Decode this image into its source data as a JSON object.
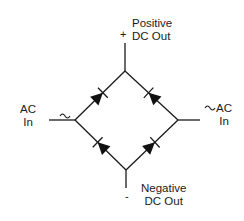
{
  "diagram": {
    "type": "bridge-rectifier",
    "colors": {
      "line": "#1a1a1a",
      "background": "#ffffff"
    },
    "labels": {
      "positive_out": {
        "line1": "Positive",
        "line2": "DC Out",
        "polarity": "+"
      },
      "negative_out": {
        "line1": "Negative",
        "line2": "DC Out",
        "polarity": "-"
      },
      "ac_in_left": {
        "line1": "AC",
        "line2": "In",
        "symbol": "~"
      },
      "ac_in_right": {
        "line1": "AC",
        "line2": "In",
        "symbol": "~"
      }
    },
    "nodes": {
      "top": [
        125,
        71
      ],
      "left": [
        75,
        120
      ],
      "right": [
        178,
        120
      ],
      "bottom": [
        126,
        170
      ]
    },
    "diodes": [
      {
        "name": "D1",
        "from": "left",
        "to": "top"
      },
      {
        "name": "D2",
        "from": "right",
        "to": "top"
      },
      {
        "name": "D3",
        "from": "bottom",
        "to": "left"
      },
      {
        "name": "D4",
        "from": "bottom",
        "to": "right"
      }
    ]
  }
}
